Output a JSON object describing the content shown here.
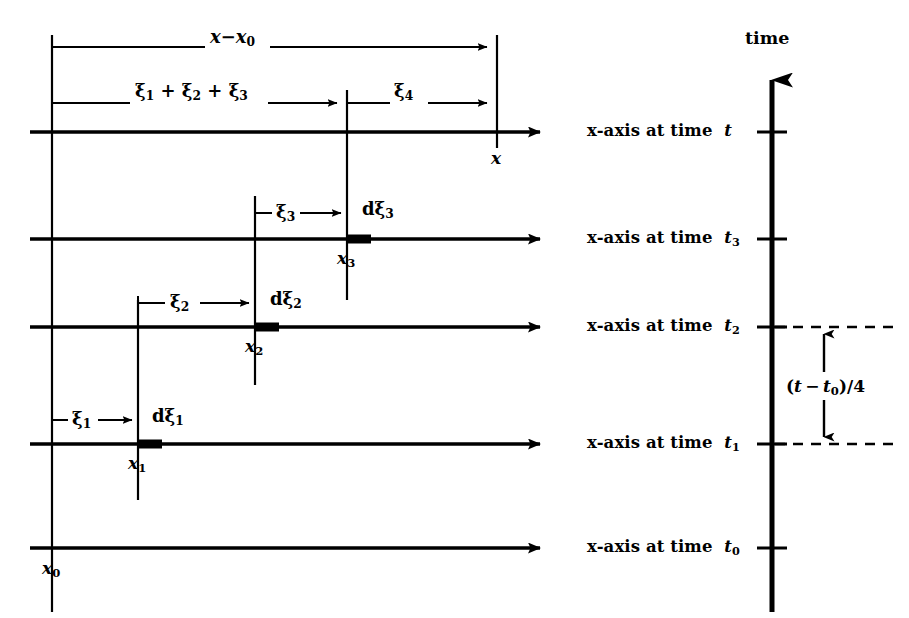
{
  "figure": {
    "type": "diagram",
    "background_color": "#ffffff",
    "ink_color": "#000000",
    "width": 909,
    "height": 618
  },
  "time_axis": {
    "title": "time",
    "orientation": "vertical-upward",
    "x_px": 772,
    "arrow_tip_y_px": 62,
    "base_y_px": 612,
    "ticks": [
      {
        "label_html": "t",
        "sub": "",
        "y_px": 132
      },
      {
        "label_html": "t",
        "sub": "3",
        "y_px": 239
      },
      {
        "label_html": "t",
        "sub": "2",
        "y_px": 327
      },
      {
        "label_html": "t",
        "sub": "1",
        "y_px": 444
      },
      {
        "label_html": "t",
        "sub": "0",
        "y_px": 548
      }
    ]
  },
  "interval_annotation": {
    "text_main": "(t",
    "text_full": "(t − t0)/4",
    "lead": "(",
    "var1": "t",
    "minus": "−",
    "var2": "t",
    "var2_sub": "0",
    "tail": ")/4",
    "between_ticks": [
      "t2",
      "t1"
    ],
    "dashed_from_x_px": 772,
    "dashed_to_x_px": 898,
    "arrow_x_px": 824,
    "arrow_top_y_px": 327,
    "arrow_bottom_y_px": 444,
    "label_x_px": 790,
    "label_y_px": 386
  },
  "rows": [
    {
      "id": "row-t",
      "time_label_prefix": "x-axis at time",
      "time_symbol": "t",
      "time_sub": "",
      "y_px": 132,
      "axis_start_x_px": 30,
      "axis_end_x_px": 552,
      "has_thick_segment": false,
      "x_marker": {
        "label": "x",
        "sub": "",
        "x_px": 497,
        "label_y_px": 148
      }
    },
    {
      "id": "row-t3",
      "time_label_prefix": "x-axis at time",
      "time_symbol": "t",
      "time_sub": "3",
      "y_px": 239,
      "axis_start_x_px": 30,
      "axis_end_x_px": 552,
      "has_thick_segment": true,
      "thick_segment": {
        "start_x_px": 347,
        "width_px": 24
      },
      "x_marker": {
        "label": "x",
        "sub": "3",
        "x_px": 347,
        "label_y_px": 255
      },
      "measure": {
        "label_greek": "ξ",
        "label_sub": "3",
        "from_x_px": 255,
        "to_x_px": 347,
        "y_px": 213,
        "label_x_px": 278,
        "d_label": "dξ",
        "d_label_sub": "3",
        "d_label_x_px": 362,
        "d_label_y_px": 205
      }
    },
    {
      "id": "row-t2",
      "time_label_prefix": "x-axis at time",
      "time_symbol": "t",
      "time_sub": "2",
      "y_px": 327,
      "axis_start_x_px": 30,
      "axis_end_x_px": 552,
      "has_thick_segment": true,
      "thick_segment": {
        "start_x_px": 255,
        "width_px": 24
      },
      "x_marker": {
        "label": "x",
        "sub": "2",
        "x_px": 255,
        "label_y_px": 343
      },
      "measure": {
        "label_greek": "ξ",
        "label_sub": "2",
        "from_x_px": 138,
        "to_x_px": 255,
        "y_px": 303,
        "label_x_px": 172,
        "d_label": "dξ",
        "d_label_sub": "2",
        "d_label_x_px": 270,
        "d_label_y_px": 295
      }
    },
    {
      "id": "row-t1",
      "time_label_prefix": "x-axis at time",
      "time_symbol": "t",
      "time_sub": "1",
      "y_px": 444,
      "axis_start_x_px": 30,
      "axis_end_x_px": 552,
      "has_thick_segment": true,
      "thick_segment": {
        "start_x_px": 138,
        "width_px": 24
      },
      "x_marker": {
        "label": "x",
        "sub": "1",
        "x_px": 138,
        "label_y_px": 460
      },
      "measure": {
        "label_greek": "ξ",
        "label_sub": "1",
        "from_x_px": 52,
        "to_x_px": 138,
        "y_px": 420,
        "label_x_px": 72,
        "d_label": "dξ",
        "d_label_sub": "1",
        "d_label_x_px": 152,
        "d_label_y_px": 412
      }
    },
    {
      "id": "row-t0",
      "time_label_prefix": "x-axis at time",
      "time_symbol": "t",
      "time_sub": "0",
      "y_px": 548,
      "axis_start_x_px": 30,
      "axis_end_x_px": 552,
      "has_thick_segment": false,
      "x_marker": {
        "label": "x",
        "sub": "0",
        "x_px": 52,
        "label_y_px": 566
      }
    }
  ],
  "top_brackets": [
    {
      "id": "bracket-x-minus-x0",
      "label_lead": "x",
      "label_minus": "−",
      "label_var": "x",
      "label_sub": "0",
      "from_x_px": 52,
      "to_x_px": 497,
      "y_px": 47,
      "label_x_px": 232,
      "label_y_px": 30
    },
    {
      "id": "bracket-xi-sum",
      "label_text": "ξ1 + ξ2 + ξ3",
      "terms": [
        "ξ",
        "1",
        "ξ",
        "2",
        "ξ",
        "3"
      ],
      "from_x_px": 52,
      "to_x_px": 347,
      "y_px": 103,
      "label_x_px": 140,
      "label_y_px": 85
    },
    {
      "id": "bracket-xi4",
      "label_greek": "ξ",
      "label_sub": "4",
      "from_x_px": 347,
      "to_x_px": 497,
      "y_px": 103,
      "label_x_px": 398,
      "label_y_px": 85
    }
  ],
  "vertical_droplines": [
    {
      "id": "dropline-x0",
      "x_px": 52,
      "from_y_px": 35,
      "to_y_px": 612
    },
    {
      "id": "dropline-x1",
      "x_px": 138,
      "from_y_px": 300,
      "to_y_px": 500
    },
    {
      "id": "dropline-x2",
      "x_px": 255,
      "from_y_px": 196,
      "to_y_px": 385
    },
    {
      "id": "dropline-x3",
      "x_px": 347,
      "from_y_px": 90,
      "to_y_px": 300
    },
    {
      "id": "dropline-x",
      "x_px": 497,
      "from_y_px": 35,
      "to_y_px": 148
    }
  ]
}
